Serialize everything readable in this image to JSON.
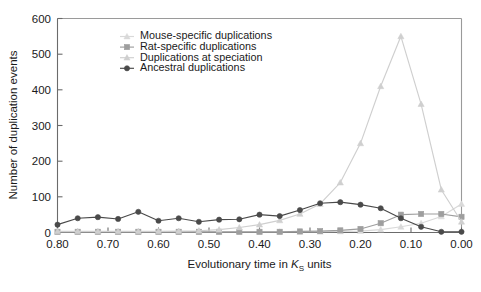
{
  "figure": {
    "background": "#ffffff"
  },
  "axes": {
    "y_label": "Number of duplication events",
    "x_label_prefix": "Evolutionary time in ",
    "x_label_symbol": "K",
    "x_label_subscript": "S",
    "x_label_suffix": " units",
    "y_ticks": [
      "600",
      "500",
      "400",
      "300",
      "200",
      "100",
      "0"
    ],
    "x_ticks": [
      "0.80",
      "0.70",
      "0.60",
      "0.50",
      "0.40",
      "0.30",
      "0.20",
      "0.10",
      "0.00"
    ]
  },
  "legend": {
    "items": [
      {
        "label": "Mouse-specific duplications",
        "color": "#d9d9d9",
        "marker": "triangle"
      },
      {
        "label": "Rat-specific duplications",
        "color": "#9e9e9e",
        "marker": "square"
      },
      {
        "label": "Duplications at speciation",
        "color": "#cfcfcf",
        "marker": "triangle"
      },
      {
        "label": "Ancestral duplications",
        "color": "#4a4a4a",
        "marker": "circle"
      }
    ]
  },
  "chart_data": {
    "type": "line",
    "title": "",
    "xlabel": "Evolutionary time in KS units",
    "ylabel": "Number of duplication events",
    "xlim": [
      0.8,
      0.0
    ],
    "ylim": [
      0,
      600
    ],
    "x_reversed": true,
    "grid": false,
    "legend_position": "top-center",
    "x": [
      0.8,
      0.76,
      0.72,
      0.68,
      0.64,
      0.6,
      0.56,
      0.52,
      0.48,
      0.44,
      0.4,
      0.36,
      0.32,
      0.28,
      0.24,
      0.2,
      0.16,
      0.12,
      0.08,
      0.04,
      0.0
    ],
    "series": [
      {
        "name": "Mouse-specific duplications",
        "color": "#d9d9d9",
        "marker": "triangle",
        "values": [
          2,
          2,
          2,
          2,
          2,
          2,
          2,
          2,
          2,
          2,
          2,
          2,
          2,
          2,
          3,
          4,
          8,
          16,
          26,
          45,
          80
        ]
      },
      {
        "name": "Rat-specific duplications",
        "color": "#9e9e9e",
        "marker": "square",
        "values": [
          2,
          2,
          2,
          2,
          2,
          2,
          2,
          2,
          2,
          2,
          2,
          2,
          3,
          4,
          6,
          10,
          26,
          50,
          52,
          52,
          44
        ]
      },
      {
        "name": "Duplications at speciation",
        "color": "#cfcfcf",
        "marker": "triangle",
        "values": [
          3,
          3,
          3,
          3,
          3,
          3,
          4,
          5,
          8,
          14,
          22,
          34,
          52,
          80,
          140,
          250,
          410,
          550,
          360,
          120,
          30
        ]
      },
      {
        "name": "Ancestral duplications",
        "color": "#4a4a4a",
        "marker": "circle",
        "values": [
          22,
          40,
          43,
          38,
          58,
          33,
          40,
          30,
          36,
          37,
          50,
          46,
          63,
          82,
          85,
          78,
          68,
          40,
          16,
          2,
          2
        ]
      }
    ]
  }
}
